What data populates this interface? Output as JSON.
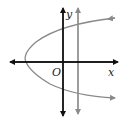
{
  "diagram": {
    "type": "coordinate-graph",
    "labels": {
      "x_axis": "x",
      "y_axis": "y",
      "origin": "O"
    },
    "elements": [
      {
        "name": "x-axis",
        "kind": "axis",
        "style": "black arrows both ends"
      },
      {
        "name": "y-axis",
        "kind": "axis",
        "style": "black arrows both ends"
      },
      {
        "name": "parabola",
        "kind": "curve",
        "description": "sideways parabola opening right, vertex left of origin",
        "color": "#888888"
      },
      {
        "name": "vertical-line",
        "kind": "line",
        "description": "vertical line right of y-axis",
        "color": "#888888"
      }
    ],
    "colors": {
      "axes": "#111111",
      "curves": "#8a8a8a"
    }
  }
}
